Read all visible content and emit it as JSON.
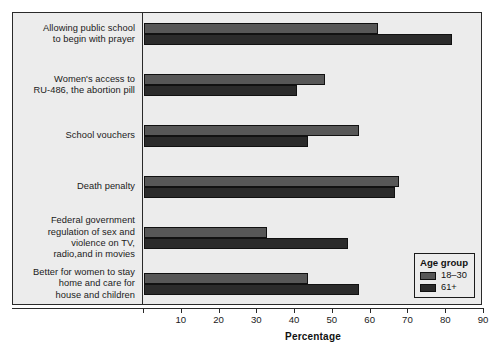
{
  "chart_data": {
    "type": "bar",
    "orientation": "horizontal",
    "title": "",
    "xlabel": "Percentage",
    "ylabel": "",
    "xlim": [
      0,
      90
    ],
    "xticks": [
      0,
      10,
      20,
      30,
      40,
      50,
      60,
      70,
      80,
      90
    ],
    "xtick_labels": [
      "",
      "10",
      "20",
      "30",
      "40",
      "50",
      "60",
      "70",
      "80",
      "90"
    ],
    "grid": false,
    "legend": {
      "title": "Age group",
      "position": "bottom-right",
      "entries": [
        {
          "label": "18–30",
          "color": "#575757"
        },
        {
          "label": "61+",
          "color": "#2b2b2b"
        }
      ]
    },
    "categories": [
      "Allowing public school\nto begin with prayer",
      "Women's access to\nRU-486, the abortion pill",
      "School vouchers",
      "Death penalty",
      "Federal government\nregulation of sex and\nviolence on TV,\nradio,and in movies",
      "Better for women to stay\nhome and care for\nhouse and children"
    ],
    "category_lines": [
      [
        "Allowing public school",
        "to begin with prayer"
      ],
      [
        "Women's access to",
        "RU-486, the abortion pill"
      ],
      [
        "School vouchers"
      ],
      [
        "Death penalty"
      ],
      [
        "Federal government",
        "regulation of sex and",
        "violence on TV,",
        "radio,and in movies"
      ],
      [
        "Better for women to stay",
        "home and care for",
        "house and children"
      ]
    ],
    "series": [
      {
        "name": "18–30",
        "color": "#575757",
        "values": [
          62,
          48,
          57,
          67.5,
          32.5,
          43.5
        ]
      },
      {
        "name": "61+",
        "color": "#2b2b2b",
        "values": [
          81.5,
          40.5,
          43.5,
          66.5,
          54,
          57
        ]
      }
    ]
  }
}
